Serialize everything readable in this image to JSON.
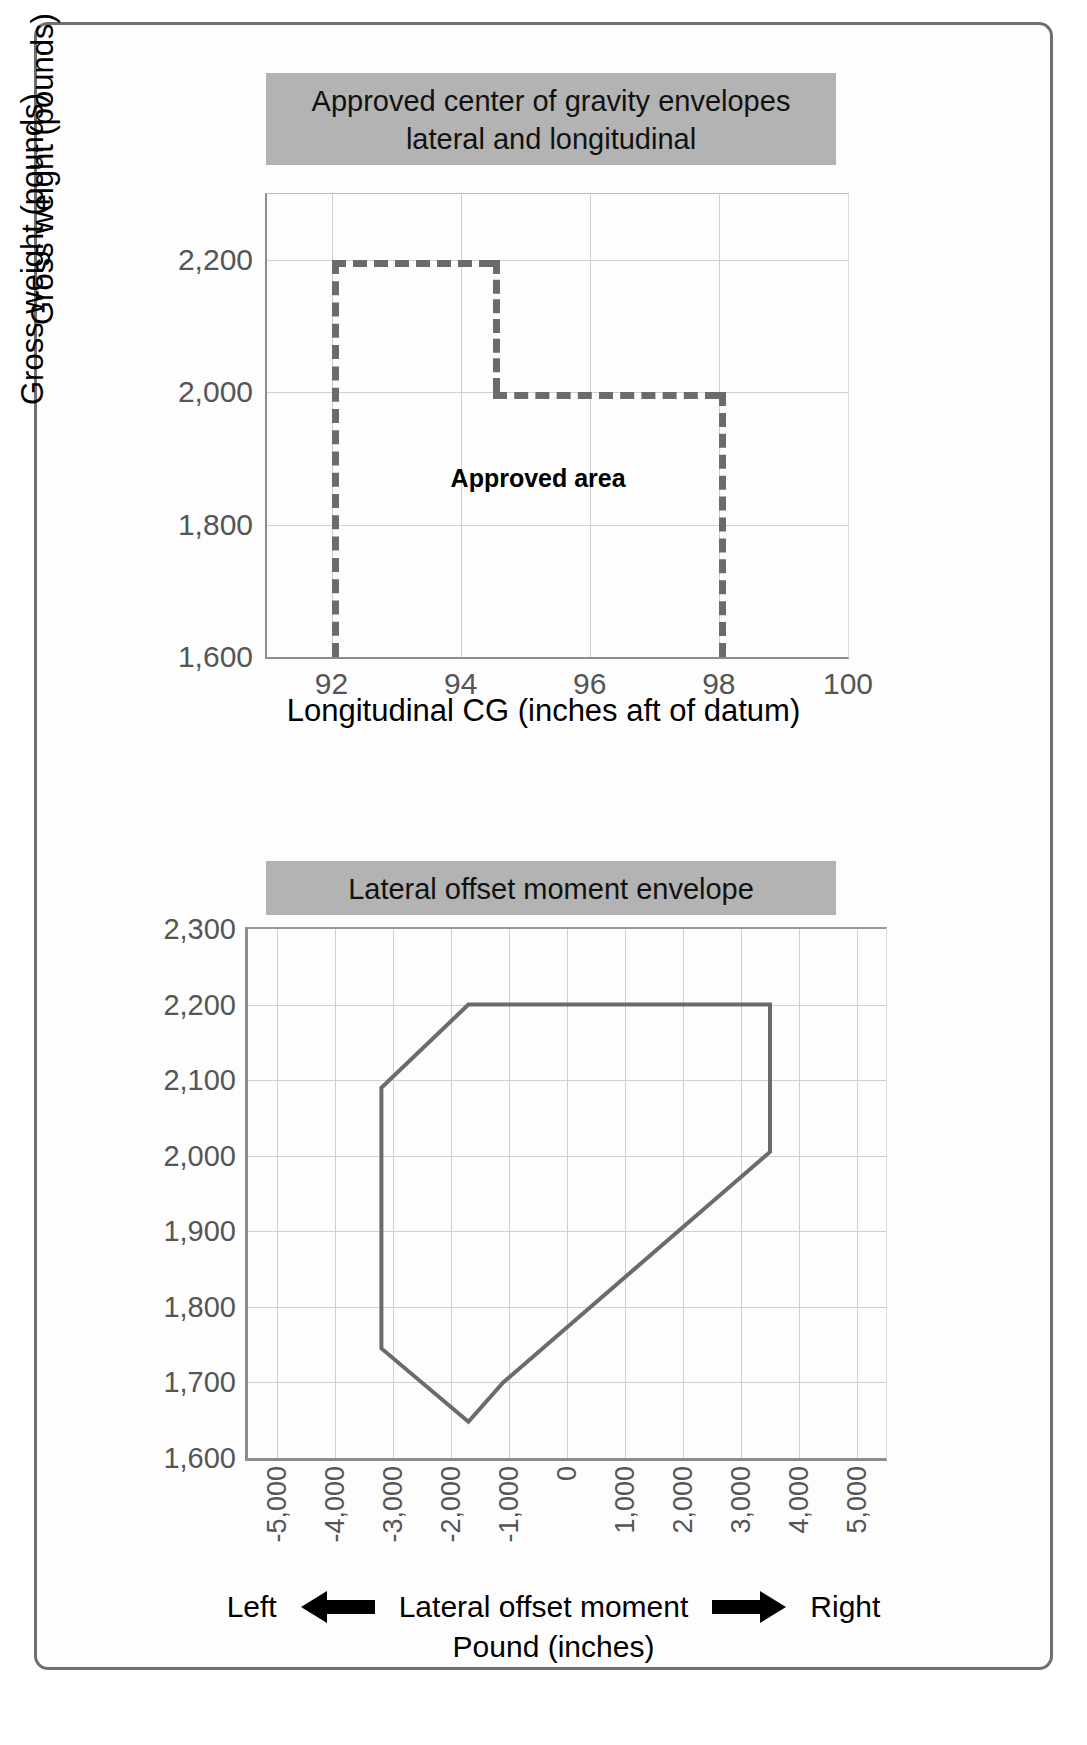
{
  "figure": {
    "charts": [
      {
        "banner_title": "Approved center of gravity envelopes\nlateral and longitudinal",
        "banner_line1": "Approved center of gravity envelopes",
        "banner_line2": "lateral and longitudinal",
        "annotation": "Approved area",
        "ylabel": "Gross weight (pounds)",
        "xlabel": "Longitudinal CG (inches aft of datum)"
      },
      {
        "banner_title": "Lateral offset moment envelope",
        "ylabel": "Gross weight (pounds)",
        "xlabel_left": "Left",
        "xlabel_center_line1": "Lateral offset moment",
        "xlabel_center_line2": "Pound (inches)",
        "xlabel_right": "Right",
        "left-arrow-icon": "left-arrow-icon",
        "right-arrow-icon": "right-arrow-icon"
      }
    ],
    "colors": {
      "banner_background": "#b3b3b3",
      "envelope_line": "#6b6b6b",
      "grid": "#cfcfcf",
      "axis": "#8c8c8c",
      "frame": "#6f6f6f",
      "tick_text": "#555555"
    }
  },
  "chart_data": [
    {
      "type": "line",
      "title": "Approved center of gravity envelopes lateral and longitudinal",
      "xlabel": "Longitudinal CG (inches aft of datum)",
      "ylabel": "Gross weight (pounds)",
      "xlim": [
        91,
        100
      ],
      "ylim": [
        1600,
        2300
      ],
      "xticks": [
        92,
        94,
        96,
        98,
        100
      ],
      "xtick_labels": [
        "92",
        "94",
        "96",
        "98",
        "100"
      ],
      "yticks": [
        1600,
        1800,
        2000,
        2200
      ],
      "ytick_labels": [
        "1,600",
        "1,800",
        "2,000",
        "2,200"
      ],
      "grid": true,
      "legend": "none",
      "linestyle": "dashed",
      "annotations": [
        {
          "text": "Approved area",
          "x": 95.2,
          "y": 1870,
          "bold": true
        }
      ],
      "series": [
        {
          "name": "Approved area envelope",
          "points": [
            {
              "x": 92,
              "y": 1600
            },
            {
              "x": 92,
              "y": 2200
            },
            {
              "x": 94.5,
              "y": 2200
            },
            {
              "x": 94.5,
              "y": 2000
            },
            {
              "x": 98,
              "y": 2000
            },
            {
              "x": 98,
              "y": 1600
            }
          ]
        }
      ]
    },
    {
      "type": "line",
      "title": "Lateral offset moment envelope",
      "xlabel": "Lateral offset moment Pound (inches)",
      "ylabel": "Gross weight (pounds)",
      "xlim": [
        -5500,
        5500
      ],
      "ylim": [
        1600,
        2300
      ],
      "xticks": [
        -5000,
        -4000,
        -3000,
        -2000,
        -1000,
        0,
        1000,
        2000,
        3000,
        4000,
        5000
      ],
      "xtick_labels": [
        "-5,000",
        "-4,000",
        "-3,000",
        "-2,000",
        "-1,000",
        "0",
        "1,000",
        "2,000",
        "3,000",
        "4,000",
        "5,000"
      ],
      "yticks": [
        1600,
        1700,
        1800,
        1900,
        2000,
        2100,
        2200,
        2300
      ],
      "ytick_labels": [
        "1,600",
        "1,700",
        "1,800",
        "1,900",
        "2,000",
        "2,100",
        "2,200",
        "2,300"
      ],
      "grid": true,
      "legend": "none",
      "linestyle": "solid",
      "series": [
        {
          "name": "Lateral offset moment envelope",
          "closed": true,
          "points": [
            {
              "x": -3200,
              "y": 2090
            },
            {
              "x": -1700,
              "y": 2200
            },
            {
              "x": 3500,
              "y": 2200
            },
            {
              "x": 3500,
              "y": 2005
            },
            {
              "x": -1100,
              "y": 1700
            },
            {
              "x": -1700,
              "y": 1648
            },
            {
              "x": -3200,
              "y": 1745
            }
          ]
        }
      ]
    }
  ]
}
